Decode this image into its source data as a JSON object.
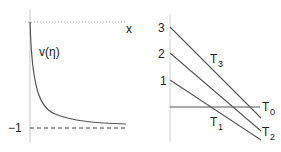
{
  "left_panel": {
    "x_label": "x",
    "curve_label": "v(η)",
    "asymptote_label": "−1",
    "colors": {
      "axis": "#bbbbbb",
      "curve": "#555555",
      "dashed": "#444444"
    }
  },
  "right_panel": {
    "y_ticks": [
      "3",
      "2",
      "1"
    ],
    "lines": [
      {
        "name": "T",
        "sub": "3"
      },
      {
        "name": "T",
        "sub": "2"
      },
      {
        "name": "T",
        "sub": "1"
      },
      {
        "name": "T",
        "sub": "0"
      }
    ],
    "colors": {
      "axis": "#cccccc",
      "line": "#555555"
    }
  }
}
